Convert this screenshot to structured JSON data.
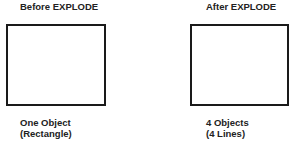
{
  "panels": [
    {
      "title": "Before EXPLODE",
      "caption_line1": "One Object",
      "caption_line2": "(Rectangle)",
      "shape": "rectangle"
    },
    {
      "title": "After EXPLODE",
      "caption_line1": "4 Objects",
      "caption_line2": "(4 Lines)",
      "shape": "rectangle-as-4-lines"
    }
  ],
  "colors": {
    "stroke": "#1a1a1a",
    "background": "#ffffff",
    "text": "#222222"
  }
}
